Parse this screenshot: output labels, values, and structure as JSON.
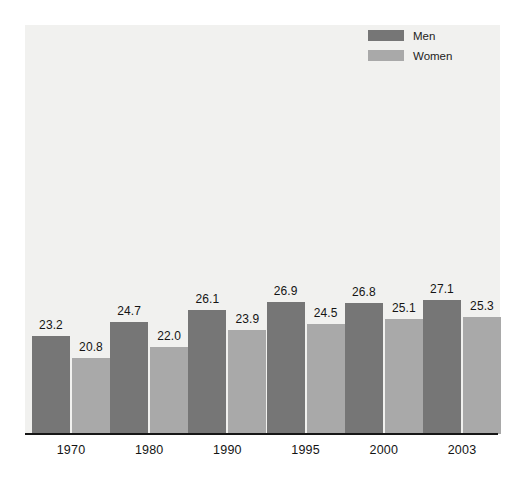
{
  "chart_data": {
    "type": "bar",
    "title": "",
    "subtitle": "",
    "xlabel": "",
    "ylabel": "",
    "grid": false,
    "legend_position": "top-right",
    "categories": [
      "1970",
      "1980",
      "1990",
      "1995",
      "2000",
      "2003"
    ],
    "series": [
      {
        "name": "Men",
        "color": "#767676",
        "values": [
          23.2,
          24.7,
          26.1,
          26.9,
          26.8,
          27.1
        ],
        "labels": [
          "23.2",
          "24.7",
          "26.1",
          "26.9",
          "26.8",
          "27.1"
        ]
      },
      {
        "name": "Women",
        "color": "#a9a9a9",
        "values": [
          20.8,
          22.0,
          23.9,
          24.5,
          25.1,
          25.3
        ],
        "labels": [
          "20.8",
          "22.0",
          "23.9",
          "24.5",
          "25.1",
          "25.3"
        ]
      }
    ],
    "ylim": [
      12.6,
      30.0
    ],
    "axis_baseline_value": 12.6,
    "value_axis_visible": false
  },
  "legend": {
    "items": [
      {
        "label": "Men",
        "color": "#767676"
      },
      {
        "label": "Women",
        "color": "#a9a9a9"
      }
    ]
  },
  "axis": {
    "x_tick_labels": [
      "1970",
      "1980",
      "1990",
      "1995",
      "2000",
      "2003"
    ],
    "line_color": "#161616"
  },
  "colors": {
    "plot_background": "#f1f1ef",
    "page_background": "#ffffff",
    "men_bar": "#767676",
    "women_bar": "#a9a9a9",
    "label_text": "#141414"
  }
}
